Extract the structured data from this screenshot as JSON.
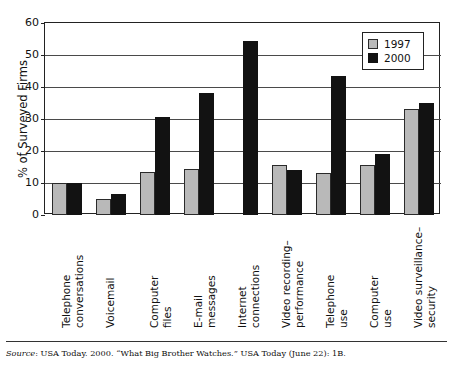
{
  "chart_data": {
    "type": "bar",
    "title": "",
    "xlabel": "",
    "ylabel": "% of Surveyed Firms",
    "ylim": [
      0,
      60
    ],
    "yticks": [
      0,
      10,
      20,
      30,
      40,
      50,
      60
    ],
    "grid": true,
    "legend_position": "top-right",
    "categories": [
      "Telephone conversations",
      "Voicemail",
      "Computer files",
      "E-mail messages",
      "Internet connections",
      "Video recording–performance",
      "Telephone use",
      "Computer use",
      "Video surveillance–security"
    ],
    "category_lines": [
      [
        "Telephone",
        "conversations"
      ],
      [
        "Voicemail"
      ],
      [
        "Computer",
        "files"
      ],
      [
        "E-mail",
        "messages"
      ],
      [
        "Internet",
        "connections"
      ],
      [
        "Video recording–",
        "performance"
      ],
      [
        "Telephone",
        "use"
      ],
      [
        "Computer",
        "use"
      ],
      [
        "Video surveillance–",
        "security"
      ]
    ],
    "series": [
      {
        "name": "1997",
        "color": "#b9b9b9",
        "values": [
          10,
          5,
          13.5,
          14.5,
          null,
          15.5,
          13,
          15.5,
          33
        ]
      },
      {
        "name": "2000",
        "color": "#121212",
        "values": [
          10,
          6.5,
          30.5,
          38,
          54.5,
          14,
          43.5,
          19,
          35
        ]
      }
    ]
  },
  "legend": {
    "entries": [
      {
        "label": "1997",
        "swatch": "light-gray-square"
      },
      {
        "label": "2000",
        "swatch": "black-square"
      }
    ]
  },
  "source_note": {
    "lead": "Source",
    "text": ": USA Today. 2000. “What Big Brother Watches.” USA Today (June 22): 1B.",
    "full": "Source: USA Today. 2000. “What Big Brother Watches.” USA Today (June 22): 1B."
  }
}
